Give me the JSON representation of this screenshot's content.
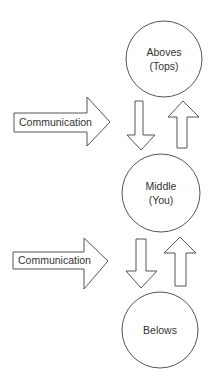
{
  "diagram": {
    "nodes": [
      {
        "id": "aboves",
        "line1": "Aboves",
        "line2": "(Tops)"
      },
      {
        "id": "middle",
        "line1": "Middle",
        "line2": "(You)"
      },
      {
        "id": "belows",
        "line1": "Belows",
        "line2": ""
      }
    ],
    "side_arrows": [
      {
        "label": "Communication"
      },
      {
        "label": "Communication"
      }
    ],
    "colors": {
      "stroke": "#555555",
      "fill": "#ffffff",
      "text": "#333333"
    }
  }
}
